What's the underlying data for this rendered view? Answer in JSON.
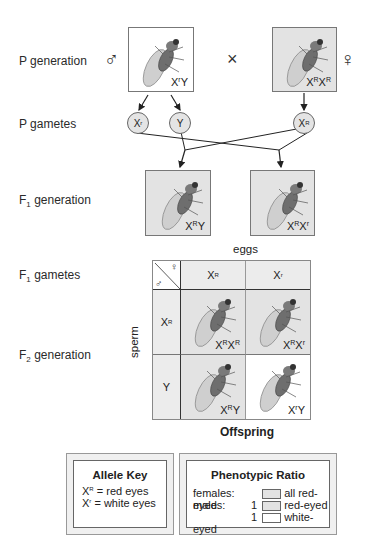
{
  "rows": {
    "p_generation": "P generation",
    "p_gametes": "P gametes",
    "f1_generation_prefix": "F",
    "f1_generation_sub": "1",
    "f1_generation_suffix": " generation",
    "f1_gametes_prefix": "F",
    "f1_gametes_sub": "1",
    "f1_gametes_suffix": " gametes",
    "f2_generation_prefix": "F",
    "f2_generation_sub": "2",
    "f2_generation_suffix": " generation"
  },
  "symbols": {
    "male": "♂",
    "female": "♀",
    "cross": "×"
  },
  "p_generation": {
    "male": {
      "base1": "X",
      "sup1": "r",
      "base2": "Y",
      "sup2": "",
      "box": "white"
    },
    "female": {
      "base1": "X",
      "sup1": "R",
      "base2": "X",
      "sup2": "R",
      "box": "grey"
    }
  },
  "p_gametes": [
    {
      "base": "X",
      "sup": "r"
    },
    {
      "base": "Y",
      "sup": ""
    },
    {
      "base": "X",
      "sup": "R"
    }
  ],
  "f1_generation": [
    {
      "base1": "X",
      "sup1": "R",
      "base2": "Y",
      "sup2": ""
    },
    {
      "base1": "X",
      "sup1": "R",
      "base2": "X",
      "sup2": "r"
    }
  ],
  "punnett": {
    "eggs_label": "eggs",
    "sperm_label": "sperm",
    "offspring_label": "Offspring",
    "egg_headers": [
      {
        "base": "X",
        "sup": "R"
      },
      {
        "base": "X",
        "sup": "r"
      }
    ],
    "sperm_headers": [
      {
        "base": "X",
        "sup": "R"
      },
      {
        "base": "Y",
        "sup": ""
      }
    ],
    "cells": [
      {
        "base1": "X",
        "sup1": "R",
        "base2": "X",
        "sup2": "R",
        "phenotype": "red-eyed"
      },
      {
        "base1": "X",
        "sup1": "R",
        "base2": "X",
        "sup2": "r",
        "phenotype": "red-eyed"
      },
      {
        "base1": "X",
        "sup1": "R",
        "base2": "Y",
        "sup2": "",
        "phenotype": "red-eyed"
      },
      {
        "base1": "X",
        "sup1": "r",
        "base2": "Y",
        "sup2": "",
        "phenotype": "white-eyed"
      }
    ]
  },
  "allele_key": {
    "title": "Allele Key",
    "entries": [
      {
        "base": "X",
        "sup": "R",
        "meaning": "= red eyes"
      },
      {
        "base": "X",
        "sup": "r",
        "meaning": "= white eyes"
      }
    ]
  },
  "phenotypic_ratio": {
    "title": "Phenotypic Ratio",
    "rows": [
      {
        "label": "females:",
        "count": "",
        "swatch": "grey",
        "desc": "all red-eyed"
      },
      {
        "label": "males:",
        "count": "1",
        "swatch": "grey",
        "desc": "red-eyed"
      },
      {
        "label": "",
        "count": "1",
        "swatch": "white",
        "desc": "white-eyed"
      }
    ]
  },
  "colors": {
    "red_eyed_fill": "#e3e3e3",
    "white_eyed_fill": "#ffffff",
    "line": "#222222"
  }
}
